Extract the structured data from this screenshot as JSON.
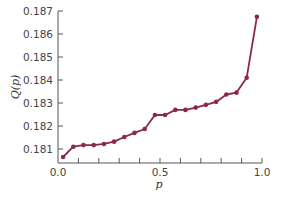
{
  "chart_data": {
    "type": "line",
    "title": "",
    "xlabel": "p",
    "ylabel": "Q(p)",
    "xlim": [
      0.0,
      1.0
    ],
    "ylim": [
      0.1805,
      0.187
    ],
    "x_ticks_major": [
      0.0,
      0.5,
      1.0
    ],
    "x_tick_labels": [
      "0.0",
      "0.5",
      "1.0"
    ],
    "x_ticks_minor_step": 0.1,
    "y_ticks": [
      0.181,
      0.182,
      0.183,
      0.184,
      0.185,
      0.186,
      0.187
    ],
    "y_tick_labels": [
      "0.181",
      "0.182",
      "0.183",
      "0.184",
      "0.185",
      "0.186",
      "0.187"
    ],
    "grid": false,
    "legend": null,
    "series": [
      {
        "name": "Q(p)",
        "color": "#8b2a45",
        "marker": "circle",
        "x": [
          0.025,
          0.075,
          0.125,
          0.175,
          0.225,
          0.275,
          0.325,
          0.375,
          0.425,
          0.475,
          0.525,
          0.575,
          0.625,
          0.675,
          0.725,
          0.775,
          0.825,
          0.875,
          0.925,
          0.975
        ],
        "values": [
          0.18065,
          0.1811,
          0.18117,
          0.18117,
          0.18122,
          0.18132,
          0.18152,
          0.1817,
          0.18187,
          0.18248,
          0.18248,
          0.1827,
          0.1827,
          0.1828,
          0.18292,
          0.18305,
          0.18337,
          0.18345,
          0.1841,
          0.18675
        ]
      }
    ]
  }
}
